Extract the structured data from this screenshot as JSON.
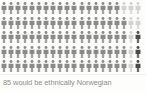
{
  "chart_data": {
    "type": "pictogram",
    "title": "",
    "caption": "85 would be ethnically Norwegian",
    "unit_label": "person",
    "total_units": 100,
    "rows": 5,
    "columns": 20,
    "categories": [
      "Ethnically Norwegian",
      "Not ethnically Norwegian",
      "Highlighted"
    ],
    "values": [
      85,
      12,
      3
    ],
    "series": [
      {
        "name": "Ethnically Norwegian",
        "value": 85,
        "color": "#8a8a86"
      },
      {
        "name": "Not ethnically Norwegian",
        "value": 12,
        "color": "#d4d3cf"
      },
      {
        "name": "Highlighted",
        "value": 3,
        "color": "#4a4a48"
      }
    ],
    "xlabel": "",
    "ylabel": "",
    "grid": false,
    "legend": "none",
    "cell_states": [
      [
        "filled",
        "filled",
        "filled",
        "filled",
        "filled",
        "filled",
        "filled",
        "filled",
        "filled",
        "filled",
        "filled",
        "filled",
        "filled",
        "filled",
        "filled",
        "filled",
        "filled",
        "empty",
        "empty",
        "empty"
      ],
      [
        "filled",
        "filled",
        "filled",
        "filled",
        "filled",
        "filled",
        "filled",
        "filled",
        "filled",
        "filled",
        "filled",
        "filled",
        "filled",
        "filled",
        "filled",
        "filled",
        "filled",
        "filled",
        "empty",
        "empty"
      ],
      [
        "filled",
        "filled",
        "filled",
        "filled",
        "filled",
        "filled",
        "filled",
        "filled",
        "filled",
        "filled",
        "filled",
        "filled",
        "filled",
        "filled",
        "filled",
        "filled",
        "filled",
        "filled",
        "empty",
        "accent"
      ],
      [
        "filled",
        "filled",
        "filled",
        "filled",
        "filled",
        "filled",
        "filled",
        "filled",
        "filled",
        "filled",
        "filled",
        "filled",
        "filled",
        "filled",
        "filled",
        "filled",
        "filled",
        "filled",
        "empty",
        "accent"
      ],
      [
        "filled",
        "filled",
        "filled",
        "filled",
        "filled",
        "filled",
        "filled",
        "filled",
        "filled",
        "filled",
        "filled",
        "filled",
        "filled",
        "filled",
        "filled",
        "filled",
        "filled",
        "filled",
        "empty",
        "accent"
      ]
    ]
  },
  "colors": {
    "figure_filled": "#8a8a86",
    "figure_empty": "#d4d3cf",
    "figure_accent": "#4a4a48",
    "caption_text": "#8d8d88",
    "background": "#fdfdfc",
    "rule": "#f2f1ef"
  },
  "caption": {
    "text": "85 would be ethnically Norwegian"
  }
}
